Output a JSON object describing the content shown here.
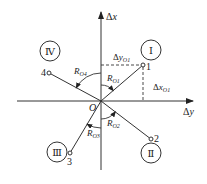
{
  "diagram": {
    "type": "coordinate-quadrant-diagram",
    "axes": {
      "vertical": {
        "label_prefix": "Δ",
        "label_var": "x"
      },
      "horizontal": {
        "label_prefix": "Δ",
        "label_var": "y"
      },
      "origin": {
        "label": "O"
      }
    },
    "quadrants": [
      {
        "id": "I",
        "label": "Ⅰ"
      },
      {
        "id": "II",
        "label": "Ⅱ"
      },
      {
        "id": "III",
        "label": "Ⅲ"
      },
      {
        "id": "IV",
        "label": "Ⅳ"
      }
    ],
    "points": [
      {
        "id": "1",
        "label": "1",
        "quadrant": "I"
      },
      {
        "id": "2",
        "label": "2",
        "quadrant": "II"
      },
      {
        "id": "3",
        "label": "3",
        "quadrant": "III"
      },
      {
        "id": "4",
        "label": "4",
        "quadrant": "IV"
      }
    ],
    "radius_labels": {
      "r1": {
        "main": "R",
        "sub": "O1"
      },
      "r2": {
        "main": "R",
        "sub": "O2"
      },
      "r3": {
        "main": "R",
        "sub": "O3"
      },
      "r4": {
        "main": "R",
        "sub": "O4"
      }
    },
    "projections": {
      "dy": {
        "prefix": "Δ",
        "main": "y",
        "sub": "O1"
      },
      "dx": {
        "prefix": "Δ",
        "main": "x",
        "sub": "O1"
      }
    }
  }
}
